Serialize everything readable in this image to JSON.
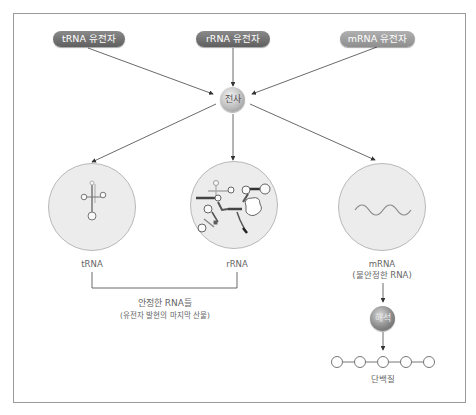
{
  "genes": {
    "trna_gene": "tRNA 유전자",
    "rrna_gene": "rRNA 유전자",
    "mrna_gene": "mRNA 유전자"
  },
  "processes": {
    "transcription": "전사",
    "translation": "해석"
  },
  "products": {
    "trna": "tRNA",
    "rrna": "rRNA",
    "mrna": "mRNA",
    "mrna_note": "(불안정한 RNA)",
    "protein": "단백질"
  },
  "stable_group": {
    "title": "안정한 RNA들",
    "subtitle": "(유전자 발현의 마지막 산물)"
  },
  "colors": {
    "pill_dark": "#6e6e6e",
    "pill_light": "#9e9e9e",
    "circle_fill": "#ececec",
    "line": "#333333"
  }
}
